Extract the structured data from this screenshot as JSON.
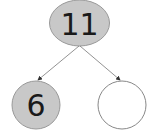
{
  "diagram": {
    "type": "number-bond",
    "whole": {
      "value": "11",
      "fill": "#c8c8c8"
    },
    "parts": [
      {
        "value": "6",
        "fill": "#c8c8c8"
      },
      {
        "value": "",
        "fill": "#ffffff"
      }
    ],
    "stroke": "#888888"
  }
}
